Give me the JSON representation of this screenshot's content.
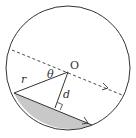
{
  "diagram": {
    "type": "geometry-circle-segment",
    "labels": {
      "center": "O",
      "radius": "r",
      "angle": "θ",
      "distance": "d"
    },
    "colors": {
      "stroke": "#333333",
      "segment_fill": "#c8c8c8",
      "background": "#ffffff"
    },
    "elements": [
      "circle",
      "dashed line through center with arrow",
      "chord with arrow",
      "radius r from O to chord endpoint",
      "perpendicular d from O to chord with right-angle mark",
      "shaded circular segment below chord"
    ]
  }
}
